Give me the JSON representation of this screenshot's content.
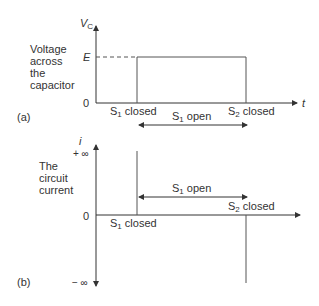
{
  "panel_a": {
    "label": "(a)",
    "ylabel_lines": [
      "Voltage",
      "across",
      "the",
      "capacitor"
    ],
    "axis_y": "V",
    "axis_y_sub": "C",
    "axis_x": "t",
    "tick_e": "E",
    "tick_zero": "0",
    "s1_closed": "S",
    "s1_sub": "1",
    "closed_word": " closed",
    "s2_closed": "S",
    "s2_sub": "2",
    "s1_open": "S",
    "open_word": " open"
  },
  "panel_b": {
    "label": "(b)",
    "ylabel_lines": [
      "The",
      "circuit",
      "current"
    ],
    "axis_y": "i",
    "tick_pos_inf": "+ ∞",
    "tick_zero": "0",
    "tick_neg_inf": "− ∞",
    "s1_closed": "S",
    "s1_sub": "1",
    "closed_word": " closed",
    "s2_closed": "S",
    "s2_sub": "2",
    "s1_open": "S",
    "open_word": " open"
  }
}
